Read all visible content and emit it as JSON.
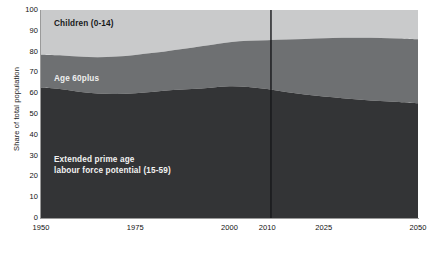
{
  "chart_data": {
    "type": "area",
    "title": "",
    "subtitle": "",
    "xlabel": "",
    "ylabel": "Share of total population",
    "xlim": [
      1950,
      2050
    ],
    "ylim": [
      0,
      100
    ],
    "grid": false,
    "legend_position": "inline-labels",
    "stacked": true,
    "stack_order_bottom_to_top": [
      "Extended prime age labour force potential (15-59)",
      "Age 60plus",
      "Children (0-14)"
    ],
    "x_tick_labels": [
      "1950",
      "1975",
      "2000",
      "2010",
      "2025",
      "2050"
    ],
    "x_tick_values": [
      1950,
      1975,
      2000,
      2010,
      2025,
      2050
    ],
    "y_tick_labels": [
      "0",
      "10",
      "20",
      "30",
      "40",
      "50",
      "60",
      "70",
      "80",
      "90",
      "100"
    ],
    "y_tick_values": [
      0,
      10,
      20,
      30,
      40,
      50,
      60,
      70,
      80,
      90,
      100
    ],
    "annotations": [
      {
        "name": "present-year-marker",
        "type": "vline",
        "x": 2011,
        "label": ""
      }
    ],
    "x": [
      1950,
      1955,
      1960,
      1965,
      1970,
      1975,
      1980,
      1985,
      1990,
      1995,
      2000,
      2005,
      2010,
      2015,
      2020,
      2025,
      2030,
      2035,
      2040,
      2045,
      2050
    ],
    "series": [
      {
        "name": "Extended prime age labour force potential (15-59)",
        "color": "#333436",
        "values": [
          62.7,
          62.0,
          60.7,
          59.8,
          59.6,
          60.0,
          60.7,
          61.5,
          62.0,
          62.6,
          63.3,
          63.0,
          62.0,
          60.6,
          59.4,
          58.4,
          57.6,
          56.9,
          56.3,
          55.8,
          55.2
        ]
      },
      {
        "name": "Age 60plus",
        "color": "#6e7072",
        "values": [
          15.8,
          16.2,
          16.9,
          17.5,
          18.0,
          18.4,
          18.7,
          19.2,
          19.9,
          20.6,
          21.2,
          22.2,
          23.5,
          25.2,
          26.7,
          28.0,
          29.0,
          29.7,
          30.2,
          30.5,
          30.7
        ]
      },
      {
        "name": "Children (0-14)",
        "color": "#c9cacb",
        "values": [
          21.5,
          21.8,
          22.4,
          22.7,
          22.4,
          21.6,
          20.6,
          19.3,
          18.1,
          16.8,
          15.5,
          14.8,
          14.5,
          14.2,
          13.9,
          13.6,
          13.4,
          13.4,
          13.5,
          13.7,
          14.1
        ]
      }
    ],
    "boundary_upper_prime_age": [
      62.7,
      62.0,
      60.7,
      59.8,
      59.6,
      60.0,
      60.7,
      61.5,
      62.0,
      62.6,
      63.3,
      63.0,
      62.0,
      60.6,
      59.4,
      58.4,
      57.6,
      56.9,
      56.3,
      55.8,
      55.2
    ],
    "boundary_upper_age60plus": [
      78.5,
      78.2,
      77.6,
      77.3,
      77.6,
      78.4,
      79.4,
      80.7,
      81.9,
      83.2,
      84.5,
      85.2,
      85.5,
      85.8,
      86.1,
      86.4,
      86.6,
      86.6,
      86.5,
      86.3,
      85.9
    ]
  },
  "axis": {
    "y_title": "Share of total population"
  },
  "labels": {
    "children": "Children (0-14)",
    "age60plus": "Age 60plus",
    "prime_line1": "Extended prime age",
    "prime_line2": "labour force potential (15-59)"
  },
  "colors": {
    "children": "#c9cacb",
    "age60plus": "#6e7072",
    "prime": "#333436",
    "marker_line": "#16171a",
    "axis": "#9a9a9a",
    "background": "#ffffff",
    "tick_text": "#111111"
  }
}
